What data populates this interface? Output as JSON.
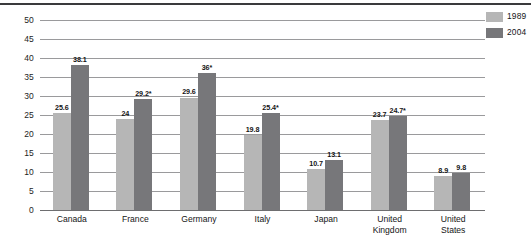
{
  "chart_data": {
    "type": "bar",
    "title": "",
    "subtitle": "",
    "xlabel": "",
    "ylabel": "",
    "ylim": [
      0,
      50
    ],
    "ytick_step": 5,
    "yticks": [
      "0",
      "5",
      "10",
      "15",
      "20",
      "25",
      "30",
      "35",
      "40",
      "45",
      "50"
    ],
    "grid": true,
    "legend_position": "top-right",
    "categories": [
      "Canada",
      "France",
      "Germany",
      "Italy",
      "Japan",
      "United Kingdom",
      "United States"
    ],
    "category_lines": [
      [
        "Canada"
      ],
      [
        "France"
      ],
      [
        "Germany"
      ],
      [
        "Italy"
      ],
      [
        "Japan"
      ],
      [
        "United",
        "Kingdom"
      ],
      [
        "United",
        "States"
      ]
    ],
    "series": [
      {
        "name": "1989",
        "color": "#b6b6b6",
        "values": [
          25.6,
          24,
          29.6,
          19.8,
          10.7,
          23.7,
          8.9
        ],
        "labels": [
          "25.6",
          "24",
          "29.6",
          "19.8",
          "10.7",
          "23.7",
          "8.9"
        ]
      },
      {
        "name": "2004",
        "color": "#77777a",
        "values": [
          38.1,
          29.2,
          36,
          25.4,
          13.1,
          24.7,
          9.8
        ],
        "labels": [
          "38.1",
          "29.2*",
          "36*",
          "25.4*",
          "13.1",
          "24.7*",
          "9.8"
        ]
      }
    ]
  },
  "legend": {
    "entries": [
      {
        "label": "1989",
        "color": "#b6b6b6"
      },
      {
        "label": "2004",
        "color": "#77777a"
      }
    ]
  },
  "colors": {
    "series_1989": "#b6b6b6",
    "series_2004": "#77777a",
    "gridline": "#9a9a9c",
    "top_rule": "#3a3a3c",
    "text": "#141414",
    "background": "#ffffff"
  }
}
